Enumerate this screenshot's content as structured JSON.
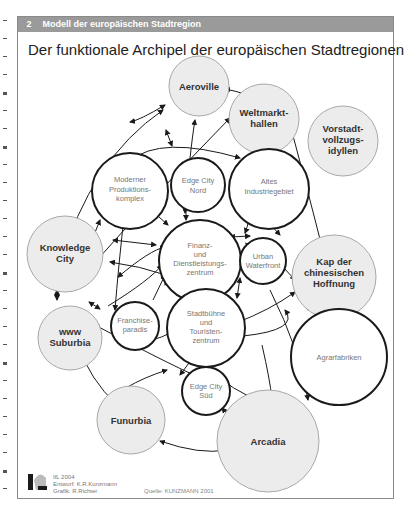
{
  "header": {
    "number": "2",
    "label": "Modell der europäischen Stadtregion",
    "bar_color": "#9a9a9a"
  },
  "title": "Der funktionale Archipel der europäischen Stadtregionen",
  "nodes": {
    "aeroville": {
      "label_lines": [
        "Aeroville"
      ],
      "style": "filled"
    },
    "weltmarkthallen": {
      "label_lines": [
        "Weltmarkt-",
        "hallen"
      ],
      "style": "filled"
    },
    "vorstadt": {
      "label_lines": [
        "Vorstadt-",
        "vollzugs-",
        "idyllen"
      ],
      "style": "filled"
    },
    "moderner": {
      "label_lines": [
        "Moderner",
        "Produktions-",
        "komplex"
      ],
      "style": "outlined"
    },
    "edge_nord": {
      "label_lines": [
        "Edge City",
        "Nord"
      ],
      "style": "outlined"
    },
    "altes": {
      "label_lines": [
        "Altes",
        "Industriegebiet"
      ],
      "style": "outlined"
    },
    "knowledge": {
      "label_lines": [
        "Knowledge",
        "City"
      ],
      "style": "filled"
    },
    "finanz": {
      "label_lines": [
        "Finanz-",
        "und",
        "Dienstleistungs-",
        "zentrum"
      ],
      "style": "outlined"
    },
    "urban": {
      "label_lines": [
        "Urban",
        "Waterfront"
      ],
      "style": "outlined"
    },
    "kap": {
      "label_lines": [
        "Kap der",
        "chinesischen",
        "Hoffnung"
      ],
      "style": "filled"
    },
    "franchise": {
      "label_lines": [
        "Franchise-",
        "paradis"
      ],
      "style": "outlined"
    },
    "www": {
      "label_lines": [
        "www",
        "Suburbia"
      ],
      "style": "filled"
    },
    "stadtbuehne": {
      "label_lines": [
        "Stadtbühne",
        "und",
        "Touristen-",
        "zentrum"
      ],
      "style": "outlined"
    },
    "agrar": {
      "label_lines": [
        "Agrarfabriken"
      ],
      "style": "outlined"
    },
    "edge_sued": {
      "label_lines": [
        "Edge City",
        "Süd"
      ],
      "style": "outlined"
    },
    "funurbia": {
      "label_lines": [
        "Funurbia"
      ],
      "style": "filled"
    },
    "arcadia": {
      "label_lines": [
        "Arcadia"
      ],
      "style": "filled"
    }
  },
  "footer": {
    "line1": "IfL 2004",
    "line2": "Entwurf: K.R.Kunzmann",
    "line3": "Grafik: R.Richter",
    "source": "Quelle: KUNZMANN 2001"
  },
  "colors": {
    "filled_node": "#ececec",
    "filled_stroke": "#a8a8a8",
    "outlined_stroke": "#1a1a1a"
  }
}
